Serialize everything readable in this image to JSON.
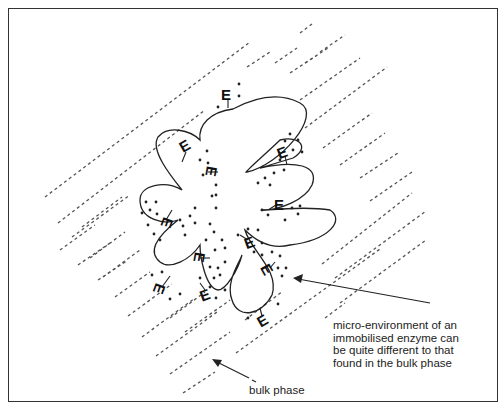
{
  "figure": {
    "type": "schematic",
    "colors": {
      "line": "#222222",
      "dashed": "#555555",
      "background": "#ffffff",
      "frame": "#333333"
    }
  },
  "labels": {
    "enzyme_symbol": "E",
    "micro_environment_lines": [
      "micro-environment of an",
      "immobilised enzyme can",
      "be quite different to that",
      "found in the bulk phase"
    ],
    "bulk_phase": "bulk phase"
  },
  "annotations": [
    {
      "id": "micro-environment-arrow",
      "from": [
        430,
        303
      ],
      "to": [
        295,
        278
      ],
      "target": "micro-environment near particle surface"
    },
    {
      "id": "bulk-phase-arrow",
      "from": [
        249,
        378
      ],
      "to": [
        215,
        361
      ],
      "target": "bulk phase dashed region"
    }
  ],
  "elements": {
    "particle": "lobed support particle (blob outline)",
    "enzymes_count": 15,
    "dashed_lines": "parallel diagonal dashed lines representing the bulk phase"
  }
}
